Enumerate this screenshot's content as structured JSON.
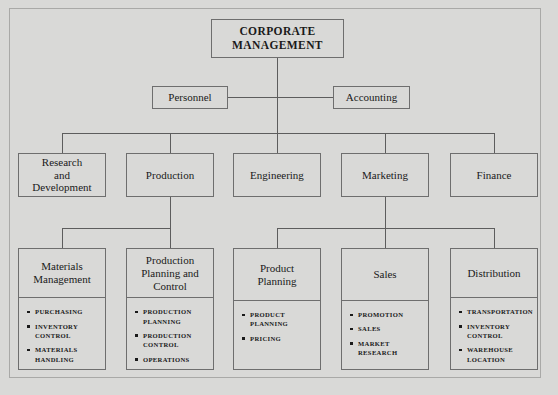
{
  "chart_title": "Corporate Organizational Chart",
  "root": {
    "label": "CORPORATE\nMANAGEMENT"
  },
  "staff": [
    {
      "label": "Personnel"
    },
    {
      "label": "Accounting"
    }
  ],
  "divisions": [
    {
      "label": "Research\nand\nDevelopment"
    },
    {
      "label": "Production"
    },
    {
      "label": "Engineering"
    },
    {
      "label": "Marketing"
    },
    {
      "label": "Finance"
    }
  ],
  "departments": [
    {
      "label": "Materials\nManagement",
      "items": [
        "PURCHASING",
        "INVENTORY\nCONTROL",
        "MATERIALS\nHANDLING"
      ]
    },
    {
      "label": "Production\nPlanning and\nControl",
      "items": [
        "PRODUCTION\nPLANNING",
        "PRODUCTION\nCONTROL",
        "OPERATIONS"
      ]
    },
    {
      "label": "Product\nPlanning",
      "items": [
        "PRODUCT\nPLANNING",
        "PRICING"
      ]
    },
    {
      "label": "Sales",
      "items": [
        "PROMOTION",
        "SALES",
        "MARKET\nRESEARCH"
      ]
    },
    {
      "label": "Distribution",
      "items": [
        "TRANSPORTATION",
        "INVENTORY\nCONTROL",
        "WAREHOUSE\nLOCATION"
      ]
    }
  ],
  "colors": {
    "background": "#d9d9d7",
    "box_border": "#6e6e6e",
    "line": "#5d5d5d",
    "text": "#1a1a1a",
    "frame": "#a9a9a7"
  }
}
